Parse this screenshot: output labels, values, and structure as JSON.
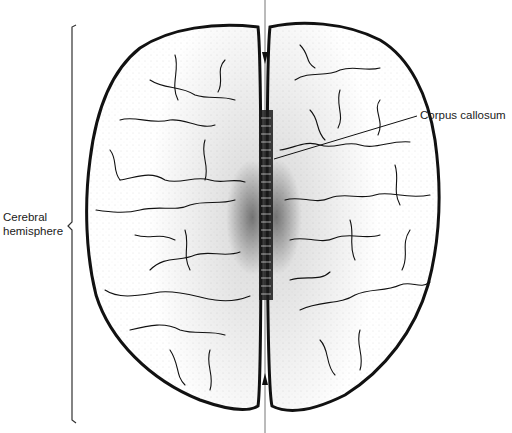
{
  "figure": {
    "labels": {
      "cerebral_hemisphere_line1": "Cerebral",
      "cerebral_hemisphere_line2": "hemisphere",
      "corpus_callosum": "Corpus callosum"
    },
    "colors": {
      "ink": "#111111",
      "background": "#ffffff",
      "stipple": "#333333",
      "midline": "#777777"
    }
  }
}
